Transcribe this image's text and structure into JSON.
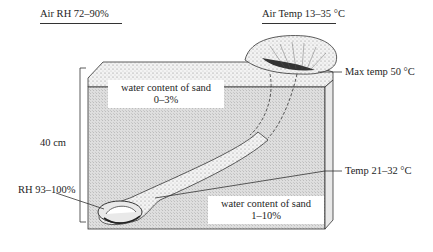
{
  "diagram": {
    "type": "cross-section of sand burrow",
    "labels": {
      "air_rh": "Air RH 72–90%",
      "air_temp": "Air Temp 13–35 °C",
      "max_temp": "Max temp 50 °C",
      "depth": "40 cm",
      "burrow_rh": "RH 93–100%",
      "burrow_temp": "Temp 21–32 °C",
      "upper_sand_title": "water content of sand",
      "upper_sand_value": "0–3%",
      "lower_sand_title": "water content of sand",
      "lower_sand_value": "1–10%"
    },
    "colors": {
      "sand_face": "#d9d9d9",
      "sand_top": "#ececec",
      "line": "#333333",
      "burrow": "#f4f4f4"
    }
  }
}
